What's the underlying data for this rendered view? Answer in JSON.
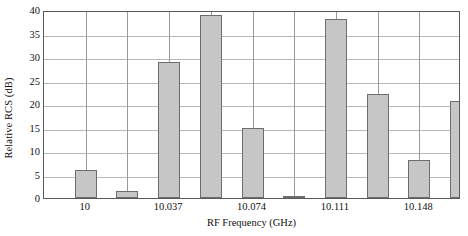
{
  "chart_data": {
    "type": "bar",
    "title": "",
    "subtitle": "",
    "xlabel": "RF Frequency (GHz)",
    "ylabel": "Relative RCS (dB)",
    "ylim": [
      0,
      40
    ],
    "yticks": [
      0,
      5,
      10,
      15,
      20,
      25,
      30,
      35,
      40
    ],
    "ytick_labels": [
      "0",
      "5",
      "10",
      "15",
      "20",
      "25",
      "30",
      "35",
      "40"
    ],
    "xlim": [
      9.9815,
      10.1665
    ],
    "xticks": [
      10,
      10.037,
      10.074,
      10.111,
      10.148
    ],
    "xtick_labels": [
      "10",
      "10.037",
      "10.074",
      "10.111",
      "10.148"
    ],
    "grid": true,
    "grid_axes": "both",
    "legend": false,
    "legend_position": "none",
    "bar_fill_color": "#c6c6c6",
    "bar_edge_color": "#6d6d6d",
    "grid_color": "#b8b8b8",
    "frame_color": "#555b5e",
    "background_color": "#ffffff",
    "categories": [
      10.0,
      10.0185,
      10.037,
      10.0555,
      10.074,
      10.0925,
      10.111,
      10.1295,
      10.148,
      10.1665
    ],
    "category_labels": [
      "10",
      "10.0185",
      "10.037",
      "10.0555",
      "10.074",
      "10.0925",
      "10.111",
      "10.1295",
      "10.148",
      "10.1665"
    ],
    "values": [
      6.0,
      1.4,
      28.9,
      39.0,
      14.9,
      0.3,
      38.1,
      22.1,
      8.1,
      20.6
    ],
    "series": [
      {
        "name": "Relative RCS",
        "values": [
          6.0,
          1.4,
          28.9,
          39.0,
          14.9,
          0.3,
          38.1,
          22.1,
          8.1,
          20.6
        ]
      }
    ],
    "annotations": []
  }
}
